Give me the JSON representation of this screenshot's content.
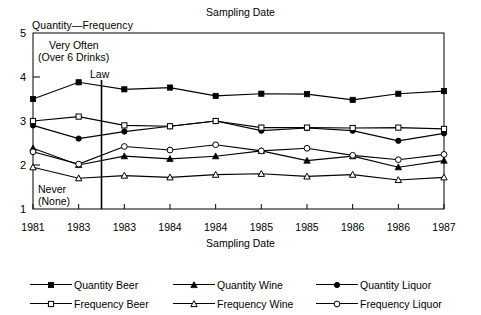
{
  "titles": {
    "top_title": "Sampling Date",
    "y_axis_label": "Quantity—Frequency",
    "x_axis_label": "Sampling Date"
  },
  "annotations": {
    "very_often_line1": "Very Often",
    "very_often_line2": "(Over 6 Drinks)",
    "law": "Law",
    "never_line1": "Never",
    "never_line2": "(None)"
  },
  "legend": {
    "rows": [
      [
        {
          "label": "Quantity Beer",
          "marker": "filled-square",
          "key_name": "legend-key-quantity-beer"
        },
        {
          "label": "Quantity Wine",
          "marker": "filled-triangle",
          "key_name": "legend-key-quantity-wine"
        },
        {
          "label": "Quantity Liquor",
          "marker": "filled-circle",
          "key_name": "legend-key-quantity-liquor"
        }
      ],
      [
        {
          "label": "Frequency Beer",
          "marker": "open-square",
          "key_name": "legend-key-frequency-beer"
        },
        {
          "label": "Frequency Wine",
          "marker": "open-triangle",
          "key_name": "legend-key-frequency-wine"
        },
        {
          "label": "Frequency Liquor",
          "marker": "open-circle",
          "key_name": "legend-key-frequency-liquor"
        }
      ]
    ]
  },
  "chart_data": {
    "type": "line",
    "title": "Sampling Date",
    "xlabel": "Sampling Date",
    "ylabel": "Quantity—Frequency",
    "categories": [
      "1981",
      "1983",
      "1983",
      "1984",
      "1984",
      "1985",
      "1985",
      "1986",
      "1986",
      "1987"
    ],
    "xtick_labels": [
      "1981",
      "1983",
      "1983",
      "1984",
      "1984",
      "1985",
      "1985",
      "1986",
      "1986",
      "1987"
    ],
    "ytick_labels": [
      "1",
      "2",
      "3",
      "4",
      "5"
    ],
    "ylim": [
      1,
      5
    ],
    "grid": false,
    "legend_position": "below",
    "annotations": [
      {
        "text": "Very Often (Over 6 Drinks)",
        "near_value": 5
      },
      {
        "text": "Never (None)",
        "near_value": 1
      },
      {
        "text": "Law",
        "type": "vertical-line",
        "x_index": 1.5
      }
    ],
    "series": [
      {
        "name": "Quantity Beer",
        "marker": "filled-square",
        "values": [
          3.5,
          3.88,
          3.72,
          3.76,
          3.57,
          3.62,
          3.61,
          3.48,
          3.62,
          3.68
        ]
      },
      {
        "name": "Quantity Wine",
        "marker": "filled-triangle",
        "values": [
          2.38,
          2.0,
          2.2,
          2.14,
          2.2,
          2.32,
          2.1,
          2.2,
          1.95,
          2.1
        ]
      },
      {
        "name": "Quantity Liquor",
        "marker": "filled-circle",
        "values": [
          2.9,
          2.6,
          2.76,
          2.88,
          3.0,
          2.78,
          2.84,
          2.78,
          2.55,
          2.72
        ]
      },
      {
        "name": "Frequency Beer",
        "marker": "open-square",
        "values": [
          3.0,
          3.1,
          2.9,
          2.88,
          3.0,
          2.85,
          2.85,
          2.84,
          2.85,
          2.82
        ]
      },
      {
        "name": "Frequency Wine",
        "marker": "open-triangle",
        "values": [
          1.95,
          1.7,
          1.76,
          1.72,
          1.78,
          1.8,
          1.74,
          1.78,
          1.66,
          1.72
        ]
      },
      {
        "name": "Frequency Liquor",
        "marker": "open-circle",
        "values": [
          2.3,
          2.02,
          2.42,
          2.34,
          2.46,
          2.32,
          2.38,
          2.22,
          2.12,
          2.24
        ]
      }
    ]
  }
}
